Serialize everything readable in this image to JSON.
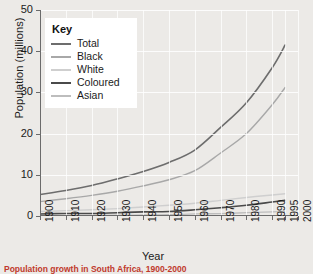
{
  "chart_data": {
    "type": "line",
    "title": "Population growth in South Africa, 1900-2000",
    "xlabel": "Year",
    "ylabel": "Population (millions)",
    "xlim": [
      1900,
      2000
    ],
    "ylim": [
      0,
      50
    ],
    "grid": true,
    "legend_position": "top-left",
    "legend_title": "Key",
    "xticks": [
      1900,
      1910,
      1920,
      1930,
      1940,
      1950,
      1960,
      1970,
      1980,
      1990,
      1995,
      2000
    ],
    "xtick_labels": [
      "1900",
      "1910",
      "1920",
      "1930",
      "1940",
      "1950",
      "1960",
      "1970",
      "1980",
      "1990",
      "1995",
      "2000"
    ],
    "yticks": [
      0,
      10,
      20,
      30,
      40,
      50
    ],
    "ytick_labels": [
      "0",
      "10",
      "20",
      "30",
      "40",
      "50"
    ],
    "x": [
      1900,
      1910,
      1920,
      1930,
      1940,
      1950,
      1960,
      1970,
      1980,
      1990,
      1995
    ],
    "series": [
      {
        "name": "Total",
        "color": "#6d6d6d",
        "width": 1.6,
        "values": [
          5.2,
          6.2,
          7.4,
          9.0,
          10.8,
          13.0,
          16.0,
          21.5,
          27.5,
          36.0,
          41.5
        ]
      },
      {
        "name": "Black",
        "color": "#a8a8a8",
        "width": 1.4,
        "values": [
          3.5,
          4.2,
          5.0,
          6.0,
          7.3,
          8.8,
          11.0,
          15.3,
          20.0,
          27.0,
          31.2
        ]
      },
      {
        "name": "White",
        "color": "#cfcfcf",
        "width": 1.4,
        "values": [
          1.1,
          1.3,
          1.5,
          1.8,
          2.2,
          2.6,
          3.1,
          3.8,
          4.5,
          5.1,
          5.4
        ]
      },
      {
        "name": "Coloured",
        "color": "#4a4a4a",
        "width": 1.6,
        "values": [
          0.5,
          0.6,
          0.6,
          0.8,
          1.0,
          1.1,
          1.5,
          2.0,
          2.6,
          3.4,
          3.8
        ]
      },
      {
        "name": "Asian",
        "color": "#bdbdbd",
        "width": 1.3,
        "values": [
          0.1,
          0.15,
          0.17,
          0.2,
          0.25,
          0.3,
          0.5,
          0.6,
          0.8,
          1.0,
          1.1
        ]
      }
    ]
  },
  "figure": {
    "caption": "Population growth in South Africa, 1900-2000",
    "caption_color": "#c0392b",
    "background": "#eceae7"
  }
}
